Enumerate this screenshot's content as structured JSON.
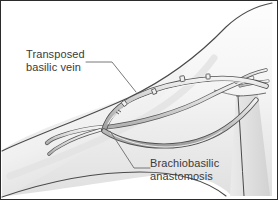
{
  "figure": {
    "border_color": "#2b2b2b",
    "background_color": "#ffffff"
  },
  "labels": {
    "transposed_vein": {
      "line1": "Transposed",
      "line2": "basilic vein",
      "text_color": "#3a3a3a"
    },
    "anastomosis": {
      "line1": "Brachiobasilic",
      "line2": "anastomosis",
      "text_color": "#3a3a3a"
    }
  },
  "anatomy": {
    "arm": {
      "name": "arm-skin",
      "fill_light": "#fbfbfb",
      "fill_mid": "#ededed",
      "fill_shadow": "#dcdcdc",
      "outline_color": "#4a4a4a"
    },
    "torso": {
      "name": "torso-edge",
      "fill": "#e6e6e6",
      "outline_color": "#4a4a4a"
    },
    "vessels": {
      "vein_fill": "#d7d7d7",
      "vein_outline": "#4f4f4f",
      "artery_fill": "#e2e2e2",
      "artery_outline": "#555555"
    },
    "clip_count": 4,
    "clip_color": "#5a5a5a"
  },
  "leaders": {
    "color": "#6a6a6a",
    "transposed_vein_leader": "from label to upper vein loop",
    "anastomosis_leader": "from vessel junction to label"
  }
}
